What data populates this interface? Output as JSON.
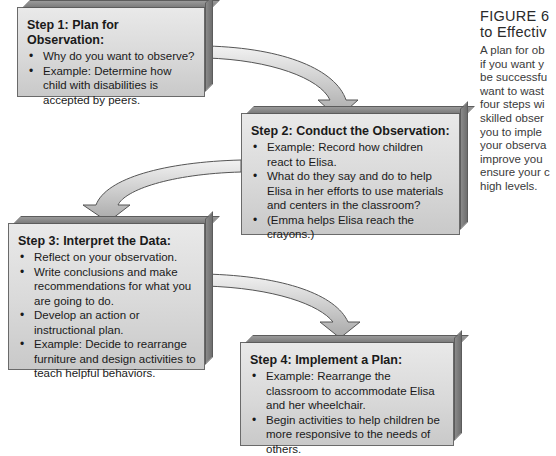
{
  "figure": {
    "title_line1": "FIGURE 6",
    "title_line2": "to Effectiv",
    "body_lines": [
      "A plan for ob",
      "if you want y",
      "be successfu",
      "want to wast",
      "four steps wi",
      "skilled obser",
      "you to imple",
      "your observa",
      "improve you",
      "ensure your c",
      "high levels."
    ]
  },
  "steps": [
    {
      "title": "Step 1: Plan for Observation:",
      "bullets": [
        "Why do you want to observe?",
        "Example: Determine how child with disabilities is accepted by peers."
      ]
    },
    {
      "title": "Step 2: Conduct the Observation:",
      "bullets": [
        "Example: Record how children react to Elisa.",
        "What do they say and do to help Elisa in her efforts to use materials and centers in the classroom?",
        "(Emma helps Elisa reach the crayons.)"
      ]
    },
    {
      "title": "Step 3: Interpret the Data:",
      "bullets": [
        "Reflect on your observation.",
        "Write conclusions and make recommendations for what you are going to do.",
        "Develop an action or instructional plan.",
        "Example: Decide to rearrange furniture and design activities to teach helpful behaviors."
      ]
    },
    {
      "title": "Step 4: Implement a Plan:",
      "bullets": [
        "Example: Rearrange the classroom to accommodate Elisa and her wheelchair.",
        "Begin activities to help children be more responsive to the needs of others."
      ]
    }
  ],
  "colors": {
    "box_fill": "#d9d9d9",
    "box_border": "#6a6a6a",
    "arrow_fill": "#c4c4c4",
    "arrow_stroke": "#555555"
  }
}
